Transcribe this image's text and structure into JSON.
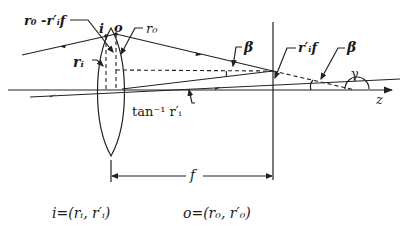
{
  "diagram": {
    "labels": {
      "top_left": "r₀ -r′ᵢf",
      "point_i": "i",
      "point_o": "o",
      "r0": "r₀",
      "ri": "rᵢ",
      "beta_1": "β",
      "focal_point": "r′ᵢf",
      "beta_2": "β",
      "gamma": "γ",
      "axis": "z",
      "arctan": "tan⁻¹ r′ᵢ",
      "focal_length": "f"
    },
    "equations": {
      "i_def": "i=(rᵢ, r′ᵢ)",
      "o_def": "o=(r₀, r′₀)"
    },
    "colors": {
      "stroke": "#222222",
      "background": "#ffffff"
    }
  }
}
